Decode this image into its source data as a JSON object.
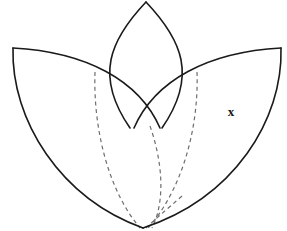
{
  "figure": {
    "background_color": "#ffffff",
    "solid_stroke_color": "#1a1a1a",
    "dashed_stroke_color": "#6e6e6e",
    "label_color": "#141414",
    "canvas": {
      "width": 287,
      "height": 231
    }
  },
  "labels": {
    "x_point": "x"
  },
  "geometry": {
    "common_vertex": {
      "x": 143,
      "y": 228
    },
    "petals": [
      {
        "name": "left-petal",
        "tip": {
          "x": 13,
          "y": 48
        },
        "outer_path": "M 13 48 C 11 120 60 198 143 228",
        "inner_path": "M 13 48 C 86 52 139 80 160 128"
      },
      {
        "name": "top-petal",
        "tip": {
          "x": 146,
          "y": 2
        },
        "left_path": "M 146 2 C 110 40 94 76 130 128",
        "right_path": "M 146 2 C 182 40 198 76 162 128"
      },
      {
        "name": "right-petal",
        "tip": {
          "x": 281,
          "y": 48
        },
        "outer_path": "M 281 48 C 283 120 234 198 143 228",
        "inner_path": "M 281 48 C 208 52 155 80 134 128"
      }
    ],
    "intersections": [
      {
        "name": "left-cross",
        "x": 95,
        "y": 72
      },
      {
        "name": "right-cross",
        "x": 197,
        "y": 72
      },
      {
        "name": "center-vee",
        "x": 145,
        "y": 125
      }
    ],
    "hidden_arcs": [
      {
        "name": "left-hidden-arc",
        "description": "continuation of top petal left arc below left-cross down to common vertex",
        "path": "M 95 72 C 93 128 108 190 140 228"
      },
      {
        "name": "right-hidden-arc",
        "description": "continuation of top petal right arc below right-cross down to common vertex",
        "path": "M 197 72 C 199 128 182 190 148 228"
      },
      {
        "name": "center-left-hidden-arc",
        "description": "inner continuation of right petal arc from center vee to common vertex",
        "path": "M 150 126 C 162 160 166 200 152 228"
      },
      {
        "name": "center-right-hidden-arc",
        "description": "short inner continuation near vertex",
        "path": "M 182 196 C 166 210 152 222 146 228"
      }
    ],
    "label_positions": [
      {
        "label": "x",
        "x": 231,
        "y": 113
      }
    ]
  }
}
